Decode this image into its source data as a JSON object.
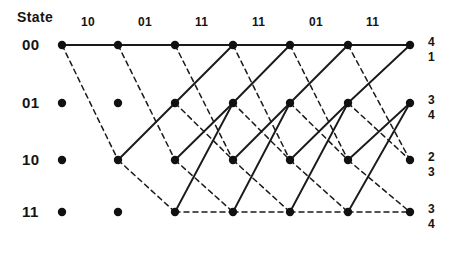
{
  "figure": {
    "type": "trellis-diagram",
    "width": 461,
    "height": 257,
    "background": "#ffffff",
    "line_color": "#1a1a1a",
    "node_color": "#111111"
  },
  "header": {
    "state_label": "State"
  },
  "received_sequence": {
    "label": "received bit pairs",
    "values": [
      "10",
      "01",
      "11",
      "11",
      "01",
      "11"
    ],
    "x_positions": [
      90,
      147,
      204,
      261,
      318,
      375
    ],
    "y": 16
  },
  "states": [
    {
      "name": "00",
      "y": 45,
      "bits": "00"
    },
    {
      "name": "01",
      "y": 103,
      "bits": "01"
    },
    {
      "name": "10",
      "y": 160,
      "bits": "10"
    },
    {
      "name": "11",
      "y": 212,
      "bits": "11"
    }
  ],
  "columns": {
    "count": 7,
    "x_positions": [
      62,
      118,
      175,
      233,
      290,
      348,
      410
    ]
  },
  "survivor_metrics": [
    {
      "state": "00",
      "top": "4",
      "bottom": "1",
      "y": 36
    },
    {
      "state": "01",
      "top": "3",
      "bottom": "4",
      "y": 94
    },
    {
      "state": "10",
      "top": "2",
      "bottom": "3",
      "y": 151
    },
    {
      "state": "11",
      "top": "3",
      "bottom": "4",
      "y": 203
    }
  ],
  "legend": {
    "solid": "input 0 branch",
    "dashed": "input 1 branch"
  },
  "chart_data": {
    "type": "diagram",
    "nodes": [
      {
        "col": 0,
        "state": "00",
        "x": 62,
        "y": 45
      },
      {
        "col": 0,
        "state": "01",
        "x": 62,
        "y": 103
      },
      {
        "col": 0,
        "state": "10",
        "x": 62,
        "y": 160
      },
      {
        "col": 0,
        "state": "11",
        "x": 62,
        "y": 212
      },
      {
        "col": 1,
        "state": "00",
        "x": 118,
        "y": 45
      },
      {
        "col": 1,
        "state": "01",
        "x": 118,
        "y": 103
      },
      {
        "col": 1,
        "state": "10",
        "x": 118,
        "y": 160
      },
      {
        "col": 1,
        "state": "11",
        "x": 118,
        "y": 212
      },
      {
        "col": 2,
        "state": "00",
        "x": 175,
        "y": 45
      },
      {
        "col": 2,
        "state": "01",
        "x": 175,
        "y": 103
      },
      {
        "col": 2,
        "state": "10",
        "x": 175,
        "y": 160
      },
      {
        "col": 2,
        "state": "11",
        "x": 175,
        "y": 212
      },
      {
        "col": 3,
        "state": "00",
        "x": 233,
        "y": 45
      },
      {
        "col": 3,
        "state": "01",
        "x": 233,
        "y": 103
      },
      {
        "col": 3,
        "state": "10",
        "x": 233,
        "y": 160
      },
      {
        "col": 3,
        "state": "11",
        "x": 233,
        "y": 212
      },
      {
        "col": 4,
        "state": "00",
        "x": 290,
        "y": 45
      },
      {
        "col": 4,
        "state": "01",
        "x": 290,
        "y": 103
      },
      {
        "col": 4,
        "state": "10",
        "x": 290,
        "y": 160
      },
      {
        "col": 4,
        "state": "11",
        "x": 290,
        "y": 212
      },
      {
        "col": 5,
        "state": "00",
        "x": 348,
        "y": 45
      },
      {
        "col": 5,
        "state": "01",
        "x": 348,
        "y": 103
      },
      {
        "col": 5,
        "state": "10",
        "x": 348,
        "y": 160
      },
      {
        "col": 5,
        "state": "11",
        "x": 348,
        "y": 212
      },
      {
        "col": 6,
        "state": "00",
        "x": 410,
        "y": 45
      },
      {
        "col": 6,
        "state": "01",
        "x": 410,
        "y": 103
      },
      {
        "col": 6,
        "state": "10",
        "x": 410,
        "y": 160
      },
      {
        "col": 6,
        "state": "11",
        "x": 410,
        "y": 212
      }
    ],
    "visible_nodes": [
      [
        0,
        "00"
      ],
      [
        0,
        "01"
      ],
      [
        0,
        "10"
      ],
      [
        0,
        "11"
      ],
      [
        1,
        "00"
      ],
      [
        1,
        "01"
      ],
      [
        1,
        "10"
      ],
      [
        1,
        "11"
      ],
      [
        2,
        "00"
      ],
      [
        2,
        "01"
      ],
      [
        2,
        "10"
      ],
      [
        2,
        "11"
      ],
      [
        3,
        "00"
      ],
      [
        3,
        "01"
      ],
      [
        3,
        "10"
      ],
      [
        3,
        "11"
      ],
      [
        4,
        "00"
      ],
      [
        4,
        "01"
      ],
      [
        4,
        "10"
      ],
      [
        4,
        "11"
      ],
      [
        5,
        "00"
      ],
      [
        5,
        "01"
      ],
      [
        5,
        "10"
      ],
      [
        5,
        "11"
      ],
      [
        6,
        "00"
      ],
      [
        6,
        "01"
      ],
      [
        6,
        "10"
      ],
      [
        6,
        "11"
      ]
    ],
    "edges": [
      {
        "from_col": 0,
        "from_state": "00",
        "to_state": "00",
        "style": "solid"
      },
      {
        "from_col": 0,
        "from_state": "00",
        "to_state": "10",
        "style": "dashed"
      },
      {
        "from_col": 1,
        "from_state": "00",
        "to_state": "00",
        "style": "solid"
      },
      {
        "from_col": 1,
        "from_state": "00",
        "to_state": "10",
        "style": "dashed"
      },
      {
        "from_col": 1,
        "from_state": "10",
        "to_state": "01",
        "style": "solid"
      },
      {
        "from_col": 1,
        "from_state": "10",
        "to_state": "11",
        "style": "dashed"
      },
      {
        "from_col": 2,
        "from_state": "00",
        "to_state": "00",
        "style": "solid"
      },
      {
        "from_col": 2,
        "from_state": "00",
        "to_state": "10",
        "style": "dashed"
      },
      {
        "from_col": 2,
        "from_state": "01",
        "to_state": "00",
        "style": "solid"
      },
      {
        "from_col": 2,
        "from_state": "01",
        "to_state": "10",
        "style": "dashed"
      },
      {
        "from_col": 2,
        "from_state": "10",
        "to_state": "01",
        "style": "solid"
      },
      {
        "from_col": 2,
        "from_state": "10",
        "to_state": "11",
        "style": "dashed"
      },
      {
        "from_col": 2,
        "from_state": "11",
        "to_state": "01",
        "style": "solid"
      },
      {
        "from_col": 2,
        "from_state": "11",
        "to_state": "11",
        "style": "dashed"
      },
      {
        "from_col": 3,
        "from_state": "00",
        "to_state": "00",
        "style": "solid"
      },
      {
        "from_col": 3,
        "from_state": "00",
        "to_state": "10",
        "style": "dashed"
      },
      {
        "from_col": 3,
        "from_state": "01",
        "to_state": "00",
        "style": "solid"
      },
      {
        "from_col": 3,
        "from_state": "01",
        "to_state": "10",
        "style": "dashed"
      },
      {
        "from_col": 3,
        "from_state": "10",
        "to_state": "01",
        "style": "solid"
      },
      {
        "from_col": 3,
        "from_state": "10",
        "to_state": "11",
        "style": "dashed"
      },
      {
        "from_col": 3,
        "from_state": "11",
        "to_state": "01",
        "style": "solid"
      },
      {
        "from_col": 3,
        "from_state": "11",
        "to_state": "11",
        "style": "dashed"
      },
      {
        "from_col": 4,
        "from_state": "00",
        "to_state": "00",
        "style": "solid"
      },
      {
        "from_col": 4,
        "from_state": "00",
        "to_state": "10",
        "style": "dashed"
      },
      {
        "from_col": 4,
        "from_state": "01",
        "to_state": "00",
        "style": "solid"
      },
      {
        "from_col": 4,
        "from_state": "01",
        "to_state": "10",
        "style": "dashed"
      },
      {
        "from_col": 4,
        "from_state": "10",
        "to_state": "01",
        "style": "solid"
      },
      {
        "from_col": 4,
        "from_state": "10",
        "to_state": "11",
        "style": "dashed"
      },
      {
        "from_col": 4,
        "from_state": "11",
        "to_state": "01",
        "style": "solid"
      },
      {
        "from_col": 4,
        "from_state": "11",
        "to_state": "11",
        "style": "dashed"
      },
      {
        "from_col": 5,
        "from_state": "00",
        "to_state": "00",
        "style": "solid"
      },
      {
        "from_col": 5,
        "from_state": "00",
        "to_state": "10",
        "style": "dashed"
      },
      {
        "from_col": 5,
        "from_state": "01",
        "to_state": "00",
        "style": "solid"
      },
      {
        "from_col": 5,
        "from_state": "01",
        "to_state": "10",
        "style": "dashed"
      },
      {
        "from_col": 5,
        "from_state": "10",
        "to_state": "01",
        "style": "solid"
      },
      {
        "from_col": 5,
        "from_state": "10",
        "to_state": "11",
        "style": "dashed"
      },
      {
        "from_col": 5,
        "from_state": "11",
        "to_state": "01",
        "style": "solid"
      },
      {
        "from_col": 5,
        "from_state": "11",
        "to_state": "11",
        "style": "dashed"
      }
    ]
  }
}
